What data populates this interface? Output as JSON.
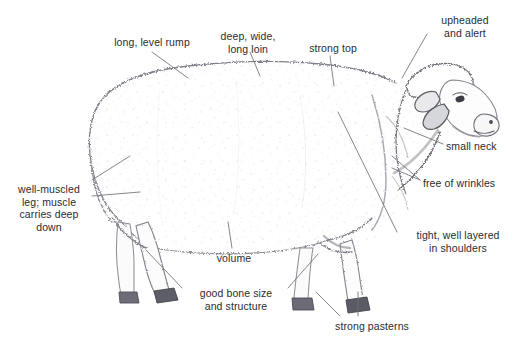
{
  "diagram": {
    "background_color": "#ffffff",
    "text_color": "#2b2b2f",
    "leader_color": "#6f7076",
    "outline_color": "#8a8b92"
  },
  "callouts": [
    {
      "id": "long-level-rump",
      "text": "long, level rump",
      "align": "center",
      "x": 100,
      "y": 36,
      "width": 104
    },
    {
      "id": "deep-wide-long-loin",
      "text": "deep, wide,\nlong loin",
      "align": "center",
      "x": 206,
      "y": 30,
      "width": 84
    },
    {
      "id": "strong-top",
      "text": "strong top",
      "align": "center",
      "x": 299,
      "y": 42,
      "width": 68
    },
    {
      "id": "upheaded-and-alert",
      "text": "upheaded\nand alert",
      "align": "center",
      "x": 429,
      "y": 14,
      "width": 72
    },
    {
      "id": "small-neck",
      "text": "small neck",
      "align": "left",
      "x": 446,
      "y": 140,
      "width": 70
    },
    {
      "id": "free-of-wrinkles",
      "text": "free of wrinkles",
      "align": "left",
      "x": 423,
      "y": 177,
      "width": 94
    },
    {
      "id": "tight-well-layered-in-shoulders",
      "text": "tight, well layered\nin shoulders",
      "align": "center",
      "x": 400,
      "y": 229,
      "width": 116
    },
    {
      "id": "well-muscled-leg",
      "text": "well-muscled\nleg; muscle\ncarries deep\ndown",
      "align": "center",
      "x": 8,
      "y": 183,
      "width": 82
    },
    {
      "id": "volume",
      "text": "volume",
      "align": "center",
      "x": 209,
      "y": 252,
      "width": 50
    },
    {
      "id": "good-bone-size-and-structure",
      "text": "good bone size\nand structure",
      "align": "center",
      "x": 186,
      "y": 287,
      "width": 100
    },
    {
      "id": "strong-pasterns",
      "text": "strong pasterns",
      "align": "center",
      "x": 324,
      "y": 320,
      "width": 96
    }
  ]
}
